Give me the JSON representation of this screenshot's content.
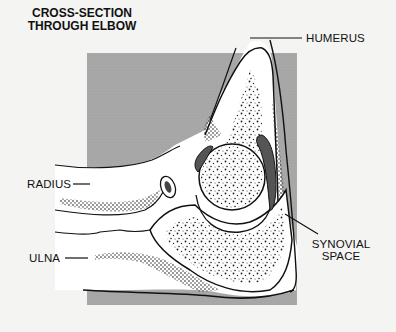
{
  "title": {
    "line1": "CROSS-SECTION",
    "line2": "THROUGH ELBOW"
  },
  "labels": {
    "humerus": "HUMERUS",
    "radius": "RADIUS",
    "ulna": "ULNA",
    "synovial_line1": "SYNOVIAL",
    "synovial_line2": "SPACE"
  },
  "colors": {
    "background": "#f4f4f2",
    "panel_gray": "#a9a9a9",
    "bone_fill": "#ffffff",
    "ink": "#111111",
    "synovial_fill": "#555555"
  }
}
